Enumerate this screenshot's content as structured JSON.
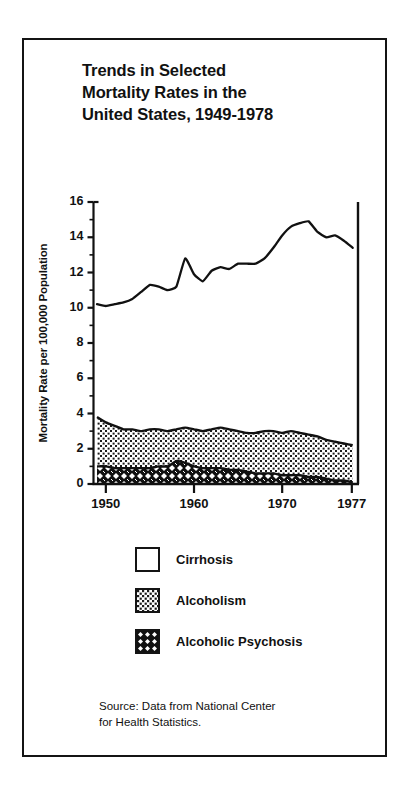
{
  "figure": {
    "title": "Trends in Selected\nMortality Rates in the\nUnited States, 1949-1978",
    "source": "Source: Data from National Center\nfor Health Statistics.",
    "border_color": "#141414",
    "background": "#ffffff"
  },
  "legend": {
    "position": "below-plot",
    "items": [
      {
        "label": "Cirrhosis",
        "pattern": "open-white",
        "swatch_name": "legend-swatch-cirrhosis"
      },
      {
        "label": "Alcoholism",
        "pattern": "light-dotted",
        "swatch_name": "legend-swatch-alcoholism"
      },
      {
        "label": "Alcoholic Psychosis",
        "pattern": "dense-diamond",
        "swatch_name": "legend-swatch-alcoholic-psychosis"
      }
    ]
  },
  "axes": {
    "ylabel": "Mortality Rate per 100,000 Population",
    "ylim": [
      0,
      16
    ],
    "yticks": [
      0,
      2,
      4,
      6,
      8,
      10,
      12,
      14,
      16
    ],
    "ytick_labels": [
      "0",
      "2",
      "4",
      "6",
      "8",
      "10",
      "12",
      "14",
      "16"
    ],
    "yminor_ticks": [
      1,
      3,
      5,
      7,
      9,
      11,
      13,
      15
    ],
    "xlim": [
      1948.6,
      1978.6
    ],
    "xticks": [
      1950,
      1960,
      1970,
      1977
    ],
    "xtick_labels": [
      "1950",
      "1960",
      "1970",
      "1977"
    ],
    "xlabel": "",
    "grid": false
  },
  "chart_data": {
    "type": "line",
    "title": "Trends in Selected Mortality Rates in the United States, 1949-1978",
    "xlabel": "",
    "ylabel": "Mortality Rate per 100,000 Population",
    "xlim": [
      1948.6,
      1978.6
    ],
    "ylim": [
      0,
      16
    ],
    "grid": false,
    "legend_position": "below-plot",
    "x": [
      1949,
      1950,
      1951,
      1952,
      1953,
      1954,
      1955,
      1956,
      1957,
      1958,
      1959,
      1960,
      1961,
      1962,
      1963,
      1964,
      1965,
      1966,
      1967,
      1968,
      1969,
      1970,
      1971,
      1972,
      1973,
      1974,
      1975,
      1976,
      1977,
      1978
    ],
    "series": [
      {
        "name": "Cirrhosis",
        "render": "line",
        "pattern": "open-white",
        "values": [
          10.2,
          10.1,
          10.2,
          10.3,
          10.5,
          10.9,
          11.3,
          11.2,
          11.0,
          11.2,
          12.8,
          11.9,
          11.5,
          12.1,
          12.3,
          12.2,
          12.5,
          12.5,
          12.5,
          12.8,
          13.4,
          14.1,
          14.6,
          14.8,
          14.9,
          14.3,
          14.0,
          14.1,
          13.8,
          13.4
        ]
      },
      {
        "name": "Alcoholism",
        "render": "stacked-band",
        "pattern": "light-dotted",
        "values": [
          3.8,
          3.5,
          3.3,
          3.1,
          3.1,
          3.0,
          3.1,
          3.1,
          3.0,
          3.1,
          3.2,
          3.1,
          3.0,
          3.1,
          3.2,
          3.1,
          3.0,
          2.9,
          2.9,
          3.0,
          3.0,
          2.9,
          3.0,
          2.9,
          2.8,
          2.7,
          2.5,
          2.4,
          2.3,
          2.2
        ]
      },
      {
        "name": "Alcoholic Psychosis",
        "render": "stacked-band",
        "pattern": "dense-diamond",
        "values": [
          1.0,
          1.0,
          0.9,
          0.9,
          0.9,
          0.9,
          0.9,
          1.0,
          1.0,
          1.3,
          1.2,
          1.0,
          0.9,
          0.9,
          0.9,
          0.8,
          0.8,
          0.7,
          0.6,
          0.6,
          0.6,
          0.5,
          0.5,
          0.5,
          0.4,
          0.4,
          0.3,
          0.2,
          0.2,
          0.1
        ]
      }
    ]
  }
}
